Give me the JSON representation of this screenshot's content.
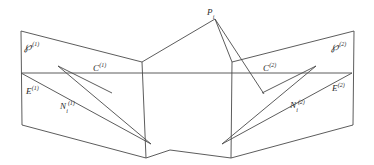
{
  "figure": {
    "background_color": "#ffffff",
    "stroke_color": "#4a4a4a",
    "text_color": "#2b2b2b",
    "width": 374,
    "height": 165
  },
  "labels": {
    "scene_point": {
      "base": "P",
      "sub": "i",
      "sup": ""
    },
    "plane_left": {
      "base": "℘",
      "sub": "",
      "sup": "(1)"
    },
    "plane_right": {
      "base": "℘",
      "sub": "",
      "sup": "(2)"
    },
    "center_left": {
      "base": "C",
      "sub": "",
      "sup": "(1)"
    },
    "center_right": {
      "base": "C",
      "sub": "",
      "sup": "(2)"
    },
    "epipole_left": {
      "base": "E",
      "sub": "",
      "sup": "(1)"
    },
    "epipole_right": {
      "base": "E",
      "sub": "",
      "sup": "(2)"
    },
    "image_point_left": {
      "base": "N",
      "sub": "i",
      "sup": "(1)"
    },
    "image_point_right": {
      "base": "N",
      "sub": "i",
      "sup": "(2)"
    }
  },
  "label_positions": {
    "scene_point": {
      "x": 207,
      "y": 8
    },
    "plane_left": {
      "x": 24,
      "y": 42
    },
    "plane_right": {
      "x": 331,
      "y": 42
    },
    "center_left": {
      "x": 93,
      "y": 62
    },
    "center_right": {
      "x": 263,
      "y": 62
    },
    "epipole_left": {
      "x": 26,
      "y": 85
    },
    "epipole_right": {
      "x": 332,
      "y": 82
    },
    "image_point_left": {
      "x": 60,
      "y": 100
    },
    "image_point_right": {
      "x": 290,
      "y": 99
    }
  },
  "geometry": {
    "left_plane_outline": "21,31 142,62 146,158 22,125",
    "right_plane_outline": "232,62 354,31 353,125 231,158",
    "left_plane_vertical_edge": "142,62 146,158",
    "right_plane_vertical_edge": "232,62 231,158",
    "baseline": "22,73 352,73",
    "upper_left_fan": "21,31 142,62",
    "left_diag_upper": "21,73 148,140",
    "left_diag_lower": "49,63 112,93",
    "right_diag_upper": "352,73 226,140",
    "right_diag_lower": "325,63 262,93",
    "cone_left_upper": "142,62 215,19",
    "cone_right_upper": "215,19 232,62",
    "cone_apex_to_left_low": "215,19 295,94",
    "cone_left_low": "146,158 170,150",
    "cone_right_low": "170,150 231,158",
    "ray_through_left": "49,63 148,140",
    "baseline_color": "#4a4a4a"
  },
  "paths": {
    "p1_top": "M 21,31 L 142,62",
    "p1_right": "M 142,62 L 146,158",
    "p1_bottom": "M 146,158 L 22,125",
    "p1_left": "M 22,125 L 21,31",
    "p2_top": "M 354,31 L 232,62",
    "p2_left": "M 232,62 L 231,158",
    "p2_bottom": "M 231,158 L 353,125",
    "p2_right": "M 353,125 L 354,31",
    "horizon": "M 22,73 L 352,73",
    "left_long_diag": "M 21,73 L 151,144",
    "left_short_diag": "M 112,93 L 58,66",
    "right_long_diag": "M 352,73 L 222,144",
    "right_short_diag": "M 262,93 L 316,66",
    "apex_left_edge": "M 142,62 L 215,19",
    "apex_right_edge": "M 215,19 L 232,62",
    "apex_ray_down": "M 215,19 L 264,94",
    "lower_left_edge": "M 146,158 L 170,150",
    "lower_right_edge": "M 170,150 L 231,158",
    "cross_left_ray": "M 58,66 L 151,144",
    "cross_right_ray": "M 316,66 L 222,144"
  }
}
